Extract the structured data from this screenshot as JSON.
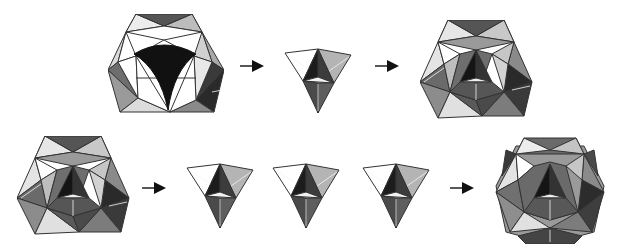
{
  "diagram": {
    "background": "#ffffff",
    "colors": {
      "white_face": "#ffffff",
      "light_face": "#d8d8d8",
      "mid_face": "#a8a8a8",
      "dark_face": "#5a5a5a",
      "black_face": "#111111",
      "edge": "#333333",
      "arrow": "#111111"
    },
    "rows": [
      {
        "steps": [
          {
            "id": "frame-with-concave-hole",
            "kind": "shape"
          },
          {
            "id": "arrow-1",
            "kind": "arrow"
          },
          {
            "id": "single-unit",
            "kind": "shape",
            "count": 1
          },
          {
            "id": "arrow-2",
            "kind": "arrow"
          },
          {
            "id": "frame-filled",
            "kind": "shape"
          }
        ]
      },
      {
        "steps": [
          {
            "id": "frame-filled-repeat",
            "kind": "shape"
          },
          {
            "id": "arrow-3",
            "kind": "arrow"
          },
          {
            "id": "units",
            "kind": "shape",
            "count": 3
          },
          {
            "id": "arrow-4",
            "kind": "arrow"
          },
          {
            "id": "complete-polyhedron",
            "kind": "shape"
          }
        ]
      }
    ],
    "text_labels": []
  }
}
